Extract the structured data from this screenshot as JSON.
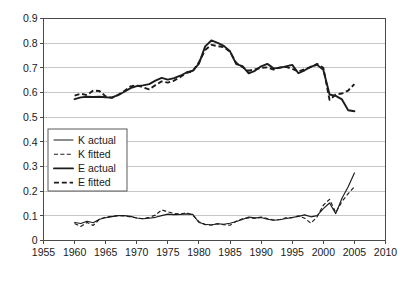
{
  "chart_data": {
    "type": "line",
    "title": "",
    "subtitle": "",
    "xlabel": "",
    "ylabel": "",
    "xlim": [
      1955,
      2010
    ],
    "ylim": [
      0,
      0.9
    ],
    "grid": true,
    "legend_position": "center-left",
    "x_ticks": [
      "1955",
      "1960",
      "1965",
      "1970",
      "1975",
      "1980",
      "1985",
      "1990",
      "1995",
      "2000",
      "2005",
      "2010"
    ],
    "y_ticks": [
      "0",
      "0.1",
      "0.2",
      "0.3",
      "0.4",
      "0.5",
      "0.6",
      "0.7",
      "0.8",
      "0.9"
    ],
    "x": [
      1960,
      1961,
      1962,
      1963,
      1964,
      1965,
      1966,
      1967,
      1968,
      1969,
      1970,
      1971,
      1972,
      1973,
      1974,
      1975,
      1976,
      1977,
      1978,
      1979,
      1980,
      1981,
      1982,
      1983,
      1984,
      1985,
      1986,
      1987,
      1988,
      1989,
      1990,
      1991,
      1992,
      1993,
      1994,
      1995,
      1996,
      1997,
      1998,
      1999,
      2000,
      2001,
      2002,
      2003,
      2004,
      2005
    ],
    "series": [
      {
        "name": "K actual",
        "style": "thin-solid",
        "values": [
          0.073,
          0.069,
          0.078,
          0.072,
          0.086,
          0.092,
          0.097,
          0.101,
          0.101,
          0.098,
          0.091,
          0.088,
          0.09,
          0.094,
          0.101,
          0.107,
          0.105,
          0.106,
          0.108,
          0.106,
          0.073,
          0.066,
          0.063,
          0.068,
          0.066,
          0.07,
          0.077,
          0.085,
          0.095,
          0.092,
          0.093,
          0.086,
          0.082,
          0.084,
          0.089,
          0.093,
          0.098,
          0.104,
          0.096,
          0.101,
          0.129,
          0.152,
          0.109,
          0.171,
          0.218,
          0.274
        ]
      },
      {
        "name": "K fitted",
        "style": "thin-dashed",
        "values": [
          0.069,
          0.057,
          0.073,
          0.061,
          0.086,
          0.095,
          0.098,
          0.101,
          0.1,
          0.096,
          0.091,
          0.088,
          0.094,
          0.103,
          0.124,
          0.116,
          0.11,
          0.107,
          0.112,
          0.103,
          0.076,
          0.064,
          0.063,
          0.068,
          0.064,
          0.062,
          0.078,
          0.088,
          0.092,
          0.09,
          0.095,
          0.089,
          0.083,
          0.085,
          0.092,
          0.093,
          0.1,
          0.09,
          0.07,
          0.096,
          0.143,
          0.167,
          0.113,
          0.158,
          0.19,
          0.218
        ]
      },
      {
        "name": "E actual",
        "style": "thick-solid",
        "values": [
          0.573,
          0.58,
          0.583,
          0.582,
          0.583,
          0.581,
          0.58,
          0.589,
          0.603,
          0.618,
          0.626,
          0.629,
          0.634,
          0.648,
          0.659,
          0.652,
          0.658,
          0.668,
          0.681,
          0.688,
          0.717,
          0.787,
          0.811,
          0.801,
          0.789,
          0.767,
          0.715,
          0.707,
          0.678,
          0.688,
          0.706,
          0.716,
          0.698,
          0.7,
          0.706,
          0.712,
          0.678,
          0.69,
          0.705,
          0.712,
          0.692,
          0.592,
          0.586,
          0.572,
          0.528,
          0.524
        ]
      },
      {
        "name": "E fitted",
        "style": "thick-dashed",
        "values": [
          0.587,
          0.595,
          0.589,
          0.608,
          0.606,
          0.584,
          0.578,
          0.591,
          0.606,
          0.625,
          0.629,
          0.621,
          0.613,
          0.63,
          0.645,
          0.64,
          0.648,
          0.663,
          0.68,
          0.686,
          0.723,
          0.772,
          0.793,
          0.788,
          0.784,
          0.765,
          0.72,
          0.703,
          0.688,
          0.694,
          0.7,
          0.702,
          0.693,
          0.702,
          0.704,
          0.696,
          0.685,
          0.695,
          0.703,
          0.716,
          0.7,
          0.57,
          0.592,
          0.596,
          0.608,
          0.634
        ]
      }
    ]
  },
  "legend": {
    "entries": [
      {
        "label": "K actual"
      },
      {
        "label": "K fitted"
      },
      {
        "label": "E actual"
      },
      {
        "label": "E fitted"
      }
    ]
  },
  "colors": {
    "line": "#1c1c1c",
    "grid": "#b9b9b9",
    "axis": "#4a4a4a",
    "background": "#ffffff"
  }
}
